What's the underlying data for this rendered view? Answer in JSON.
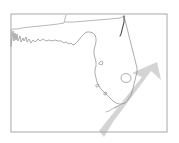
{
  "figure": {
    "kind": "outline-map",
    "background_color": "#ffffff",
    "width": 179,
    "height": 143,
    "labels": [],
    "title": "",
    "caption": ""
  },
  "frame": {
    "name": "map-border",
    "x": 11,
    "y": 14,
    "width": 156,
    "height": 118,
    "stroke_color": "#a8a8a8",
    "stroke_width": 1,
    "fill": "none"
  },
  "geography": {
    "coastline": {
      "name": "florida-coastline",
      "stroke_color": "#8a8a8a",
      "stroke_width": 0.7,
      "fill": "none",
      "path": "M11,46 L13,31 L14,41 L15,33 L16,40 L17,34 L18,41 L20,36 L21,42 L23,38 L24,41 L26,37 L27,42 L29,39 L31,43 L33,40 L35,42 L38,39 L40,41 L43,39 L46,41 L49,40 L52,41 L55,40 L58,41 L61,41 L64,43 L66,42 L69,44 L71,43 L73,45 L75,44 L77,42 L79,40 L81,37 L83,35 L85,33 L87,32 L90,32 L93,33 L95,35 L96,38 L96,42 L95,46 L94,50 L94,54 L95,58 L96,62 L96,66 L95,70 L95,74 L96,78 L97,82 L99,86 L101,89 L104,92 L107,95 L110,98 L113,101 L116,103 L119,104 L122,104 L125,103 L127,101 L129,98 L131,95 L132,92 L133,88 L134,84 L135,80 L136,76 L137,72 L137,68 L136,64 L135,60 L134,56 L133,52 L132,48 L131,44 L130,40 L129,36 L128,32 L127,28 L126,24 L125,20 L124,16"
    },
    "state_border": {
      "name": "state-boundary-line",
      "stroke_color": "#9a9a9a",
      "stroke_width": 0.7,
      "fill": "none",
      "path": "M11,46 L11,30 L13,29 L17,29 L22,28 L30,27 L40,26 L50,25 L58,24 L64,23 L65,19 L66,15 M65,22 L74,22 L86,21 L98,20 L110,19 L120,18 L124,16"
    },
    "east_coast_detail": {
      "name": "atlantic-coast-detail",
      "stroke_color": "#555555",
      "stroke_width": 1.1,
      "fill": "none",
      "path": "M124,16 L124,22 L123,26 L122,30 L121,34 L120,36"
    },
    "keys": {
      "name": "florida-keys",
      "stroke_color": "#9a9a9a",
      "stroke_width": 0.7,
      "fill": "none",
      "path": "M120,105 L116,107 L112,109 L109,111 L106,112 M118,106 L115,108"
    },
    "lake_okeechobee": {
      "name": "lake-okeechobee",
      "stroke_color": "#8a8a8a",
      "stroke_width": 0.7,
      "fill": "none",
      "center_x": 126,
      "center_y": 78,
      "rx": 5,
      "ry": 4.5
    },
    "inland_marks": {
      "name": "inland-feature-marks",
      "stroke_color": "#909090",
      "stroke_width": 0.7,
      "path": "M99,63 L101,61 L103,62 L102,65 L99,64 Z M96,85 L98,84 L99,86 L97,87 Z M104,93 L106,92 L107,94 L105,95 Z"
    }
  },
  "annotation": {
    "arrow": {
      "name": "direction-arrow",
      "label": "",
      "fill_color": "#c6c6c6",
      "opacity": 0.75,
      "direction": "northeast",
      "tail_x": 104,
      "tail_y": 137,
      "tip_x": 160,
      "tip_y": 63,
      "path": "M157,62 L161,80 L151,71 L113,122 L104,137 L99,131 L142,77 L132,73 Z"
    }
  }
}
